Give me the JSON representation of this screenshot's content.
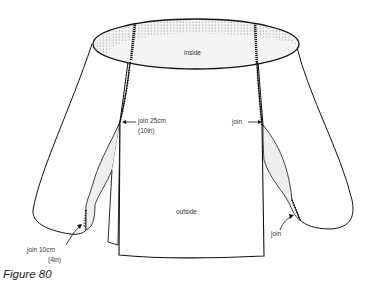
{
  "figure": {
    "caption": "Figure 80",
    "labels": {
      "inside": "inside",
      "outside": "outside",
      "join_top_left_line1": "join 25cm",
      "join_top_left_line2": "(10in)",
      "join_top_right": "join",
      "join_bottom_left_line1": "join 10cm",
      "join_bottom_left_line2": "(4in)",
      "join_bottom_right": "join"
    },
    "colors": {
      "line": "#111111",
      "shade": "#eeeeee",
      "dots": "#333333"
    }
  }
}
